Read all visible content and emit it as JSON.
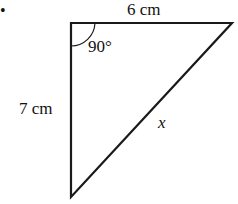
{
  "diagram": {
    "type": "right-triangle",
    "top_side_label": "6 cm",
    "left_side_label": "7 cm",
    "hypotenuse_label": "x",
    "angle_label": "90°",
    "bullet": "•"
  }
}
